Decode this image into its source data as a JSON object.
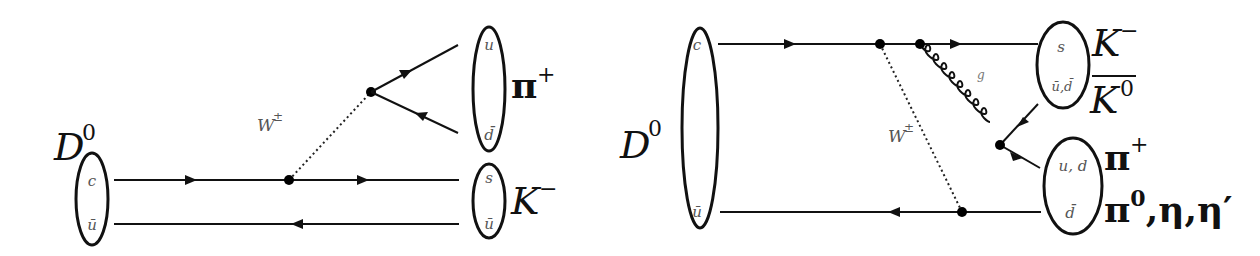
{
  "diagrams": [
    {
      "name": "tree-level-external-W",
      "initial_meson": {
        "label": "D",
        "sup": "0",
        "quarks": [
          "c",
          "ū"
        ]
      },
      "boson": {
        "label": "W",
        "sup": "±"
      },
      "final_mesons": [
        {
          "label": "π",
          "sup": "+",
          "quarks": [
            "u",
            "d̄"
          ]
        },
        {
          "label": "K",
          "sup": "−",
          "quarks": [
            "s",
            "ū"
          ]
        }
      ]
    },
    {
      "name": "W-exchange-with-gluon",
      "initial_meson": {
        "label": "D",
        "sup": "0",
        "quarks": [
          "c",
          "ū"
        ]
      },
      "boson": {
        "label": "W",
        "sup": "±"
      },
      "gluon": {
        "label": "g"
      },
      "final_mesons": [
        {
          "labels": [
            "K",
            "K"
          ],
          "sups": [
            "−",
            "0"
          ],
          "bar_second": true,
          "quarks": [
            "s",
            "ū,d̄"
          ]
        },
        {
          "labels": [
            "π",
            "π"
          ],
          "sups": [
            "+",
            "0"
          ],
          "suffix": ",η,η′",
          "quarks": [
            "u, d",
            "d̄"
          ]
        }
      ]
    }
  ]
}
